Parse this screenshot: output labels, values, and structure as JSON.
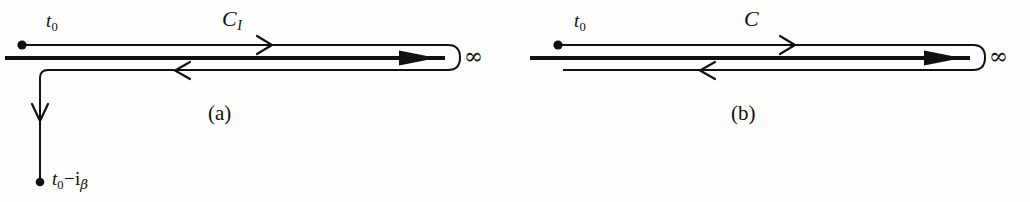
{
  "figure": {
    "ink_color": "#111111",
    "background_color": "#fdfdfc"
  },
  "panels": [
    {
      "id": "a",
      "caption": "(a)",
      "start_label": "t",
      "start_label_sub": "0",
      "contour_label": "C",
      "contour_label_sub": "I",
      "infinity_label": "∞",
      "endpoint_label": {
        "var": "t",
        "sub": "0",
        "minus": "−",
        "imaginary_unit": "i",
        "sub_beta": "β"
      },
      "has_vertical_branch": true,
      "forward_arrow": "arrowhead-right",
      "return_arrow": "arrowhead-left",
      "axis_arrow": "arrowhead-right-solid",
      "down_arrow": "arrowhead-down"
    },
    {
      "id": "b",
      "caption": "(b)",
      "start_label": "t",
      "start_label_sub": "0",
      "contour_label": "C",
      "contour_label_sub": "",
      "infinity_label": "∞",
      "has_vertical_branch": false,
      "forward_arrow": "arrowhead-right",
      "return_arrow": "arrowhead-left",
      "axis_arrow": "arrowhead-right-solid"
    }
  ]
}
